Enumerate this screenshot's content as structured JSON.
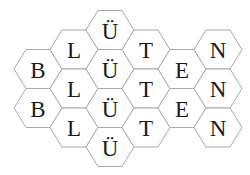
{
  "puzzle": {
    "type": "hexagon-letter-grid",
    "columns": [
      {
        "letter": "B",
        "cells": [
          "B",
          "B"
        ]
      },
      {
        "letter": "L",
        "cells": [
          "L",
          "L",
          "L"
        ]
      },
      {
        "letter": "Ü",
        "cells": [
          "Ü",
          "Ü",
          "Ü",
          "Ü"
        ]
      },
      {
        "letter": "T",
        "cells": [
          "T",
          "T",
          "T"
        ]
      },
      {
        "letter": "E",
        "cells": [
          "E",
          "E"
        ]
      },
      {
        "letter": "N",
        "cells": [
          "N",
          "N",
          "N"
        ]
      }
    ],
    "word": "BLÜTEN"
  },
  "colors": {
    "hex_stroke": "#a8a8a8",
    "hex_fill": "#ffffff",
    "letter": "#1a1a1a"
  }
}
